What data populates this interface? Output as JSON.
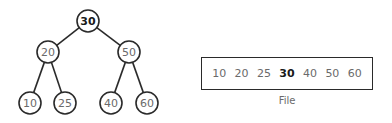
{
  "tree": {
    "nodes": [
      {
        "id": "n30",
        "value": "30",
        "bold": true,
        "parent": null
      },
      {
        "id": "n20",
        "value": "20",
        "bold": false,
        "parent": "n30"
      },
      {
        "id": "n50",
        "value": "50",
        "bold": false,
        "parent": "n30"
      },
      {
        "id": "n10",
        "value": "10",
        "bold": false,
        "parent": "n20"
      },
      {
        "id": "n25",
        "value": "25",
        "bold": false,
        "parent": "n20"
      },
      {
        "id": "n40",
        "value": "40",
        "bold": false,
        "parent": "n50"
      },
      {
        "id": "n60",
        "value": "60",
        "bold": false,
        "parent": "n50"
      }
    ]
  },
  "file": {
    "items": [
      {
        "value": "10",
        "bold": false
      },
      {
        "value": "20",
        "bold": false
      },
      {
        "value": "25",
        "bold": false
      },
      {
        "value": "30",
        "bold": true
      },
      {
        "value": "40",
        "bold": false
      },
      {
        "value": "50",
        "bold": false
      },
      {
        "value": "60",
        "bold": false
      }
    ],
    "label": "File"
  }
}
